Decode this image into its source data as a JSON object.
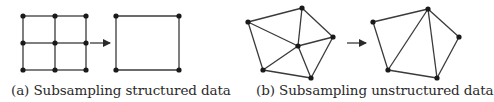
{
  "figure": {
    "panels": [
      {
        "id": "a",
        "caption": "(a) Subsampling structured data",
        "before": {
          "nodes": [
            [
              23,
              16
            ],
            [
              55,
              16
            ],
            [
              86,
              16
            ],
            [
              23,
              43
            ],
            [
              55,
              43
            ],
            [
              86,
              43
            ],
            [
              23,
              70
            ],
            [
              55,
              70
            ],
            [
              86,
              70
            ]
          ],
          "edges": [
            [
              0,
              1
            ],
            [
              1,
              2
            ],
            [
              3,
              4
            ],
            [
              4,
              5
            ],
            [
              6,
              7
            ],
            [
              7,
              8
            ],
            [
              0,
              3
            ],
            [
              3,
              6
            ],
            [
              1,
              4
            ],
            [
              4,
              7
            ],
            [
              2,
              5
            ],
            [
              5,
              8
            ]
          ]
        },
        "arrow": {
          "x1": 90,
          "y1": 43,
          "x2": 110,
          "y2": 43
        },
        "after": {
          "nodes": [
            [
              116,
              16
            ],
            [
              179,
              16
            ],
            [
              116,
              70
            ],
            [
              179,
              70
            ]
          ],
          "edges": [
            [
              0,
              1
            ],
            [
              1,
              3
            ],
            [
              3,
              2
            ],
            [
              2,
              0
            ]
          ]
        }
      },
      {
        "id": "b",
        "caption": "(b) Subsampling unstructured data",
        "before": {
          "nodes": [
            [
              248,
              22
            ],
            [
              302,
              8
            ],
            [
              333,
              37
            ],
            [
              298,
              46
            ],
            [
              263,
              70
            ],
            [
              311,
              78
            ]
          ],
          "edges": [
            [
              0,
              1
            ],
            [
              1,
              2
            ],
            [
              0,
              3
            ],
            [
              1,
              3
            ],
            [
              3,
              2
            ],
            [
              0,
              4
            ],
            [
              4,
              3
            ],
            [
              4,
              5
            ],
            [
              3,
              5
            ],
            [
              5,
              2
            ]
          ]
        },
        "arrow": {
          "x1": 347,
          "y1": 43,
          "x2": 366,
          "y2": 43
        },
        "after": {
          "nodes": [
            [
              373,
              22
            ],
            [
              428,
              9
            ],
            [
              459,
              37
            ],
            [
              388,
              70
            ],
            [
              437,
              78
            ]
          ],
          "edges": [
            [
              0,
              1
            ],
            [
              1,
              2
            ],
            [
              2,
              4
            ],
            [
              4,
              3
            ],
            [
              3,
              0
            ],
            [
              3,
              1
            ],
            [
              1,
              4
            ]
          ]
        }
      }
    ],
    "colors": {
      "stroke": "#3a3a3a",
      "node": "#1a1a1a",
      "text": "#2a2a2a"
    }
  }
}
